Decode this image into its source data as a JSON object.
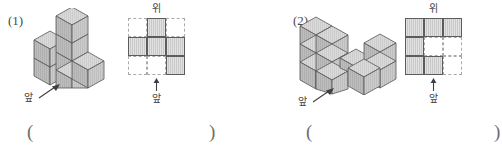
{
  "page": {
    "type": "math-worksheet",
    "colors": {
      "cube_top": "#d8d8d8",
      "cube_left": "#b9b9b9",
      "cube_right": "#cfcfcf",
      "cube_outline": "#555555",
      "grid_filled": "#c9c9c9",
      "grid_solid_border": "#5c5c5c",
      "grid_dashed_border": "#a9a9a9",
      "text": "#3f3f3f"
    }
  },
  "problems": [
    {
      "number": "(1)",
      "solid": {
        "front_label": "앞",
        "arrow_icon": "arrow-up-right-icon"
      },
      "topview": {
        "top_label": "위",
        "front_label": "앞",
        "arrow_icon": "arrow-up-icon",
        "rows": 3,
        "cols": 3,
        "cells": [
          [
            "empty",
            "filled",
            "empty"
          ],
          [
            "filled",
            "filled",
            "filled"
          ],
          [
            "empty",
            "empty",
            "filled"
          ]
        ]
      },
      "answer": {
        "open_paren": "(",
        "close_paren": ")",
        "value": ""
      }
    },
    {
      "number": "(2)",
      "solid": {
        "front_label": "앞",
        "arrow_icon": "arrow-up-right-icon"
      },
      "topview": {
        "top_label": "위",
        "front_label": "앞",
        "arrow_icon": "arrow-up-icon",
        "rows": 3,
        "cols": 3,
        "cells": [
          [
            "filled",
            "filled",
            "filled"
          ],
          [
            "filled",
            "empty",
            "empty"
          ],
          [
            "filled",
            "filled",
            "empty"
          ]
        ]
      },
      "answer": {
        "open_paren": "(",
        "close_paren": ")",
        "value": ""
      }
    }
  ]
}
